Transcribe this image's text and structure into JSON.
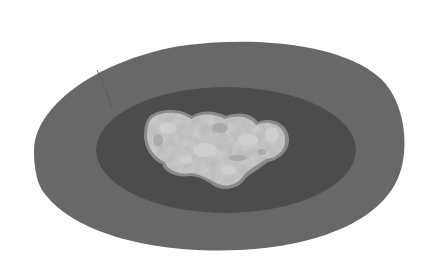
{
  "image": {
    "description": "Grayscale image of an irregular light nugget resting in the center of a dark oval pan",
    "colors": {
      "background": "#ffffff",
      "outer_rim": "#6a6a6a",
      "inner_basin": "#4e4e4e",
      "nugget_light": "#c4c4c4",
      "nugget_mid": "#a8a8a8",
      "nugget_edge": "#8a8a8a"
    }
  }
}
